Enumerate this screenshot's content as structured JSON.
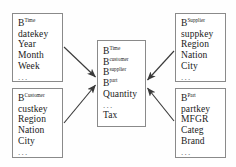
{
  "diagram": {
    "background_color": "#fefefe",
    "box_border_color": "#8a8a8a",
    "arrow_color": "#3a3a3a",
    "text_color": "#1a1a1a"
  },
  "boxes": {
    "time": {
      "name": "Time dimension",
      "header_base": "B",
      "header_sup": "Time",
      "fields": [
        "datekey",
        "Year",
        "Month",
        "Week"
      ],
      "ellipsis": "..."
    },
    "customer": {
      "name": "Customer dimension",
      "header_base": "B",
      "header_sup": "Customer",
      "fields": [
        "custkey",
        "Region",
        "Nation",
        "City"
      ],
      "ellipsis": "..."
    },
    "supplier": {
      "name": "Supplier dimension",
      "header_base": "B",
      "header_sup": "Supplier",
      "fields": [
        "suppkey",
        "Region",
        "Nation",
        "City"
      ],
      "ellipsis": "..."
    },
    "part": {
      "name": "Part dimension",
      "header_base": "B",
      "header_sup": "Part",
      "fields": [
        "partkey",
        "MFGR",
        "Categ",
        "Brand"
      ],
      "ellipsis": "..."
    },
    "fact": {
      "name": "Fact table",
      "refs": [
        {
          "base": "B",
          "sup": "Time"
        },
        {
          "base": "B",
          "sup": "customer"
        },
        {
          "base": "B",
          "sup": "supplier"
        },
        {
          "base": "B",
          "sup": "part"
        }
      ],
      "measure_1": "Quantity",
      "ellipsis": "...",
      "measure_2": "Tax"
    }
  },
  "arrows": [
    {
      "name": "time-to-fact",
      "from": "time",
      "to": "fact"
    },
    {
      "name": "customer-to-fact",
      "from": "customer",
      "to": "fact"
    },
    {
      "name": "supplier-to-fact",
      "from": "supplier",
      "to": "fact"
    },
    {
      "name": "part-to-fact",
      "from": "part",
      "to": "fact"
    }
  ]
}
